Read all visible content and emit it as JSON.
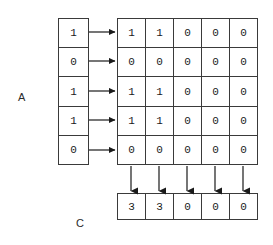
{
  "diagram": {
    "labels": {
      "input_vector": "A",
      "output_vector": "C"
    },
    "input_vector": {
      "name": "A",
      "orientation": "column",
      "values": [
        "1",
        "0",
        "1",
        "1",
        "0"
      ]
    },
    "matrix": {
      "rows": 5,
      "cols": 5,
      "values": [
        [
          "1",
          "1",
          "0",
          "0",
          "0"
        ],
        [
          "0",
          "0",
          "0",
          "0",
          "0"
        ],
        [
          "1",
          "1",
          "0",
          "0",
          "0"
        ],
        [
          "1",
          "1",
          "0",
          "0",
          "0"
        ],
        [
          "0",
          "0",
          "0",
          "0",
          "0"
        ]
      ]
    },
    "output_vector": {
      "name": "C",
      "orientation": "row",
      "values": [
        "3",
        "3",
        "0",
        "0",
        "0"
      ]
    },
    "arrows": {
      "row_arrows_count": 5,
      "column_arrows_count": 5,
      "row_arrow_direction": "right",
      "column_arrow_direction": "down",
      "color": "#1a1a1a"
    },
    "colors": {
      "background": "#ffffff",
      "stroke": "#3a3a3a",
      "text": "#1a1a1a",
      "label": "#2b2b2b"
    }
  }
}
